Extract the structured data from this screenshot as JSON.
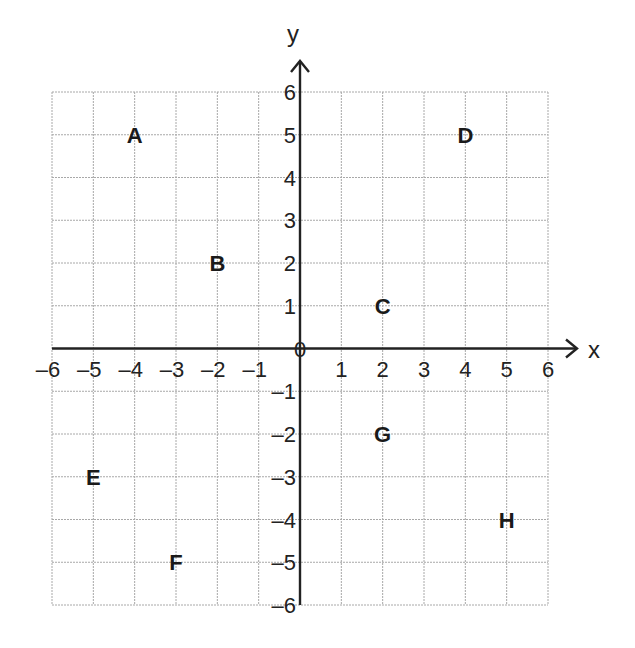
{
  "chart_data": {
    "type": "scatter",
    "title": "",
    "xlabel": "x",
    "ylabel": "y",
    "xlim": [
      -6,
      6
    ],
    "ylim": [
      -6,
      6
    ],
    "grid": true,
    "x_ticks": [
      -6,
      -5,
      -4,
      -3,
      -2,
      -1,
      0,
      1,
      2,
      3,
      4,
      5,
      6
    ],
    "y_ticks": [
      -6,
      -5,
      -4,
      -3,
      -2,
      -1,
      0,
      1,
      2,
      3,
      4,
      5,
      6
    ],
    "x_tick_labels": [
      "–6",
      "–5",
      "–4",
      "–3",
      "–2",
      "–1",
      "1",
      "2",
      "3",
      "4",
      "5",
      "6"
    ],
    "y_tick_labels": [
      "6",
      "5",
      "4",
      "3",
      "2",
      "1",
      "–1",
      "–2",
      "–3",
      "–4",
      "–5",
      "–6"
    ],
    "origin_label": "0",
    "points": [
      {
        "label": "A",
        "x": -4,
        "y": 5
      },
      {
        "label": "B",
        "x": -2,
        "y": 2
      },
      {
        "label": "C",
        "x": 2,
        "y": 1
      },
      {
        "label": "D",
        "x": 4,
        "y": 5
      },
      {
        "label": "E",
        "x": -5,
        "y": -3
      },
      {
        "label": "F",
        "x": -3,
        "y": -5
      },
      {
        "label": "G",
        "x": 2,
        "y": -2
      },
      {
        "label": "H",
        "x": 5,
        "y": -4
      }
    ]
  },
  "colors": {
    "grid": "#a8a8a8",
    "axis": "#222222",
    "text": "#1a1a1a",
    "background": "#ffffff"
  }
}
